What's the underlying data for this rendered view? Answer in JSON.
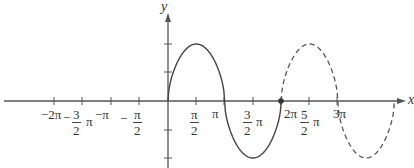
{
  "figure": {
    "axes": {
      "x_label": "x",
      "y_label": "y",
      "origin_px": [
        168,
        101
      ],
      "units_per_half_pi_px": 28.3
    },
    "x_ticks": [
      {
        "label": "-2π",
        "value": -6.283
      },
      {
        "label": "-3/2 π",
        "value": -4.712
      },
      {
        "label": "-π",
        "value": -3.1416
      },
      {
        "label": "-π/2",
        "value": -1.5708
      },
      {
        "label": "π/2",
        "value": 1.5708
      },
      {
        "label": "π",
        "value": 3.1416
      },
      {
        "label": "3/2 π",
        "value": 4.712
      },
      {
        "label": "2π",
        "value": 6.283
      },
      {
        "label": "5/2 π",
        "value": 7.854
      },
      {
        "label": "3π",
        "value": 9.425
      }
    ],
    "y_ticks_px": [
      44,
      72,
      130,
      158
    ],
    "tick_labels": {
      "neg_two_pi": "−2π",
      "neg_three_halves_num": "3",
      "neg_three_halves_den": "2",
      "neg_three_halves_minus": "−",
      "neg_three_halves_pi": "π",
      "neg_pi": "−π",
      "neg_half_minus": "−",
      "neg_half_num": "π",
      "neg_half_den": "2",
      "half_num": "π",
      "half_den": "2",
      "pi": "π",
      "three_halves_num": "3",
      "three_halves_den": "2",
      "three_halves_pi": "π",
      "two_pi": "2π",
      "five_halves_num": "5",
      "five_halves_den": "2",
      "five_halves_pi": "π",
      "three_pi": "3π"
    },
    "curve": {
      "solid_range": "0 to 2π",
      "dashed_range": "2π to 4π",
      "marked_point": "(2π, 0)",
      "amplitude_ticks": 2,
      "stroke_color": "#444444"
    }
  }
}
